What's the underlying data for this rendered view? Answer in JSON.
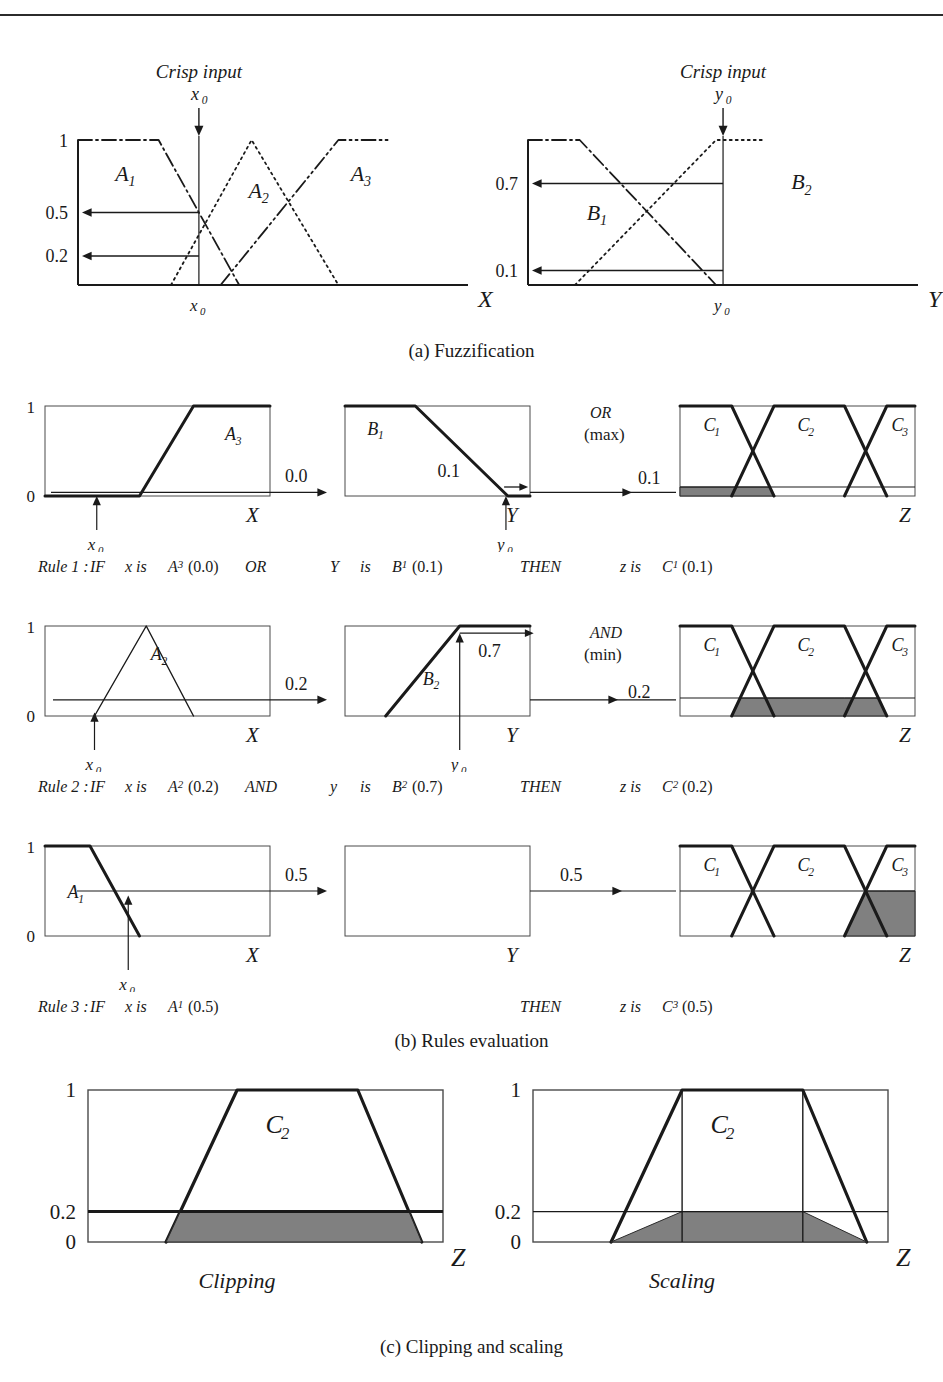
{
  "figure": {
    "top_rule": true,
    "captions": {
      "a": "(a) Fuzzification",
      "b": "(b)  Rules evaluation",
      "c": "(c)  Clipping and scaling"
    }
  },
  "colors": {
    "ink": "#1a1a1a",
    "thin_line": "#4a4a4a",
    "shade_fill": "#808080",
    "shade_stroke": "#2b2b2b"
  },
  "fuzzification": {
    "crisp_label": "Crisp input",
    "left": {
      "input_label": "x₀",
      "axis_label": "X",
      "axis_tick_label": "x₀",
      "y_ticks": [
        "1",
        "0.5",
        "0.2"
      ],
      "sets": [
        "A₁",
        "A₂",
        "A₃"
      ],
      "memberships": {
        "A₁": 0.5,
        "A₂": 0.2,
        "A₃": 0.0
      }
    },
    "right": {
      "input_label": "y₀",
      "axis_label": "Y",
      "axis_tick_label": "y₀",
      "y_ticks": [
        "0.7",
        "0.1"
      ],
      "sets": [
        "B₁",
        "B₂"
      ],
      "memberships": {
        "B₁": 0.1,
        "B₂": 0.7
      }
    }
  },
  "rules": [
    {
      "id": "rule1",
      "number": "Rule 1",
      "operator_label": "OR",
      "operator_sub": "(max)",
      "antecedent_value": "0.0",
      "second_value": "0.1",
      "result_value": "0.1",
      "x_panel": {
        "set": "A₃",
        "axis_label": "X",
        "tick_label": "x₀",
        "y_ticks": [
          "1",
          "0"
        ],
        "shape": "up-trapezoid",
        "membership": 0.0
      },
      "y_panel": {
        "set": "B₁",
        "axis_label": "Y",
        "tick_label": "y₀",
        "shape": "down-trapezoid",
        "membership": 0.1
      },
      "z_panel": {
        "sets": [
          "C₁",
          "C₂",
          "C₃"
        ],
        "axis_label": "Z",
        "clip": 0.1,
        "clipped_set_index": 0
      },
      "text": {
        "prefix": "Rule 1 :",
        "if": "IF",
        "x_is": "x  is",
        "x_set": "A₃",
        "x_val": "(0.0)",
        "op": "OR",
        "y_var": "Y",
        "y_is": "is",
        "y_set": "B₁",
        "y_val": "(0.1)",
        "then": "THEN",
        "z_is": "z  is",
        "z_set": "C₁",
        "z_val": "(0.1)"
      }
    },
    {
      "id": "rule2",
      "number": "Rule 2",
      "operator_label": "AND",
      "operator_sub": "(min)",
      "antecedent_value": "0.2",
      "second_value": "0.7",
      "result_value": "0.2",
      "x_panel": {
        "set": "A₂",
        "axis_label": "X",
        "tick_label": "x₀",
        "y_ticks": [
          "1",
          "0"
        ],
        "shape": "triangle",
        "membership": 0.2
      },
      "y_panel": {
        "set": "B₂",
        "axis_label": "Y",
        "tick_label": "y₀",
        "shape": "up-ramp",
        "membership": 0.7
      },
      "z_panel": {
        "sets": [
          "C₁",
          "C₂",
          "C₃"
        ],
        "axis_label": "Z",
        "clip": 0.2,
        "clipped_set_index": 1
      },
      "text": {
        "prefix": "Rule 2 :",
        "if": "IF",
        "x_is": "x  is",
        "x_set": "A₂",
        "x_val": "(0.2)",
        "op": "AND",
        "y_var": "y",
        "y_is": "is",
        "y_set": "B₂",
        "y_val": "(0.7)",
        "then": "THEN",
        "z_is": "z  is",
        "z_set": "C₂",
        "z_val": "(0.2)"
      }
    },
    {
      "id": "rule3",
      "number": "Rule 3",
      "operator_label": "",
      "operator_sub": "",
      "antecedent_value": "0.5",
      "second_value": "0.5",
      "result_value": "0.5",
      "x_panel": {
        "set": "A₁",
        "axis_label": "X",
        "tick_label": "x₀",
        "y_ticks": [
          "1",
          "0"
        ],
        "shape": "down-ramp",
        "membership": 0.5
      },
      "y_panel": {
        "set": "",
        "axis_label": "Y",
        "tick_label": "",
        "shape": "empty",
        "membership": null
      },
      "z_panel": {
        "sets": [
          "C₁",
          "C₂",
          "C₃"
        ],
        "axis_label": "Z",
        "clip": 0.5,
        "clipped_set_index": 2
      },
      "text": {
        "prefix": "Rule 3 :",
        "if": "IF",
        "x_is": "x  is",
        "x_set": "A₁",
        "x_val": "(0.5)",
        "op": "",
        "y_var": "",
        "y_is": "",
        "y_set": "",
        "y_val": "",
        "then": "THEN",
        "z_is": "z  is",
        "z_set": "C₃",
        "z_val": "(0.5)"
      }
    }
  ],
  "clip_scale": {
    "clipping": {
      "title": "Clipping",
      "set_label": "C₂",
      "axis_label": "Z",
      "y_ticks": [
        "1",
        "0.2",
        "0"
      ],
      "level": 0.2
    },
    "scaling": {
      "title": "Scaling",
      "set_label": "C₂",
      "axis_label": "Z",
      "y_ticks": [
        "1",
        "0.2",
        "0"
      ],
      "level": 0.2
    }
  },
  "chart_data": {
    "type": "line",
    "panels": [
      {
        "name": "fuzzification-x",
        "xlabel": "X",
        "ylabel": "",
        "ylim": [
          0,
          1
        ],
        "yticks": [
          0.2,
          0.5,
          1
        ],
        "crisp_input": "x0",
        "series": [
          {
            "name": "A1",
            "style": "dash-dot",
            "points": [
              [
                0,
                1
              ],
              [
                0.26,
                1
              ],
              [
                0.52,
                0
              ]
            ]
          },
          {
            "name": "A2",
            "style": "dotted",
            "points": [
              [
                0.3,
                0
              ],
              [
                0.56,
                1
              ],
              [
                0.84,
                0
              ]
            ]
          },
          {
            "name": "A3",
            "style": "dash-dot-dot",
            "points": [
              [
                0.46,
                0
              ],
              [
                0.84,
                1
              ],
              [
                1,
                1
              ]
            ]
          }
        ],
        "readings": {
          "A1": 0.5,
          "A2": 0.2,
          "A3": 0.0
        }
      },
      {
        "name": "fuzzification-y",
        "xlabel": "Y",
        "ylabel": "",
        "ylim": [
          0,
          1
        ],
        "yticks": [
          0.1,
          0.7
        ],
        "crisp_input": "y0",
        "series": [
          {
            "name": "B1",
            "style": "dash-dot",
            "points": [
              [
                0,
                1
              ],
              [
                0.22,
                1
              ],
              [
                0.8,
                0
              ]
            ]
          },
          {
            "name": "B2",
            "style": "dotted",
            "points": [
              [
                0.2,
                0
              ],
              [
                0.8,
                1
              ],
              [
                1,
                1
              ]
            ]
          }
        ],
        "readings": {
          "B1": 0.1,
          "B2": 0.7
        }
      },
      {
        "name": "rule1-x",
        "xlabel": "X",
        "ylim": [
          0,
          1
        ],
        "series": [
          {
            "name": "A3",
            "points": [
              [
                0,
                0
              ],
              [
                0.42,
                0
              ],
              [
                0.66,
                1
              ],
              [
                1,
                1
              ]
            ]
          }
        ],
        "reading": 0.0
      },
      {
        "name": "rule1-y",
        "xlabel": "Y",
        "ylim": [
          0,
          1
        ],
        "series": [
          {
            "name": "B1",
            "points": [
              [
                0,
                1
              ],
              [
                0.38,
                1
              ],
              [
                0.88,
                0
              ],
              [
                1,
                0
              ]
            ]
          }
        ],
        "reading": 0.1
      },
      {
        "name": "rule1-z",
        "xlabel": "Z",
        "ylim": [
          0,
          1
        ],
        "clip": 0.1,
        "series": [
          {
            "name": "C1",
            "points": [
              [
                0,
                1
              ],
              [
                0.22,
                1
              ],
              [
                0.4,
                0
              ]
            ]
          },
          {
            "name": "C2",
            "points": [
              [
                0.22,
                0
              ],
              [
                0.4,
                1
              ],
              [
                0.7,
                1
              ],
              [
                0.88,
                0
              ]
            ]
          },
          {
            "name": "C3",
            "points": [
              [
                0.7,
                0
              ],
              [
                0.88,
                1
              ],
              [
                1,
                1
              ]
            ]
          }
        ]
      },
      {
        "name": "rule2-x",
        "xlabel": "X",
        "ylim": [
          0,
          1
        ],
        "series": [
          {
            "name": "A2",
            "points": [
              [
                0.22,
                0
              ],
              [
                0.45,
                1
              ],
              [
                0.66,
                0
              ]
            ]
          }
        ],
        "reading": 0.2
      },
      {
        "name": "rule2-y",
        "xlabel": "Y",
        "ylim": [
          0,
          1
        ],
        "series": [
          {
            "name": "B2",
            "points": [
              [
                0.22,
                0
              ],
              [
                0.62,
                1
              ],
              [
                1,
                1
              ]
            ]
          }
        ],
        "reading": 0.7
      },
      {
        "name": "rule2-z",
        "xlabel": "Z",
        "ylim": [
          0,
          1
        ],
        "clip": 0.2,
        "series": [
          {
            "name": "C1",
            "points": [
              [
                0,
                1
              ],
              [
                0.22,
                1
              ],
              [
                0.4,
                0
              ]
            ]
          },
          {
            "name": "C2",
            "points": [
              [
                0.22,
                0
              ],
              [
                0.4,
                1
              ],
              [
                0.7,
                1
              ],
              [
                0.88,
                0
              ]
            ]
          },
          {
            "name": "C3",
            "points": [
              [
                0.7,
                0
              ],
              [
                0.88,
                1
              ],
              [
                1,
                1
              ]
            ]
          }
        ]
      },
      {
        "name": "rule3-x",
        "xlabel": "X",
        "ylim": [
          0,
          1
        ],
        "series": [
          {
            "name": "A1",
            "points": [
              [
                0,
                1
              ],
              [
                0.2,
                1
              ],
              [
                0.42,
                0
              ]
            ]
          }
        ],
        "reading": 0.5
      },
      {
        "name": "rule3-y",
        "xlabel": "Y",
        "ylim": [
          0,
          1
        ],
        "series": []
      },
      {
        "name": "rule3-z",
        "xlabel": "Z",
        "ylim": [
          0,
          1
        ],
        "clip": 0.5,
        "series": [
          {
            "name": "C1",
            "points": [
              [
                0,
                1
              ],
              [
                0.22,
                1
              ],
              [
                0.4,
                0
              ]
            ]
          },
          {
            "name": "C2",
            "points": [
              [
                0.22,
                0
              ],
              [
                0.4,
                1
              ],
              [
                0.7,
                1
              ],
              [
                0.88,
                0
              ]
            ]
          },
          {
            "name": "C3",
            "points": [
              [
                0.7,
                0
              ],
              [
                0.88,
                1
              ],
              [
                1,
                1
              ]
            ]
          }
        ]
      },
      {
        "name": "clipping",
        "xlabel": "Z",
        "ylim": [
          0,
          1
        ],
        "clip": 0.2,
        "series": [
          {
            "name": "C2",
            "points": [
              [
                0.22,
                0
              ],
              [
                0.42,
                1
              ],
              [
                0.76,
                1
              ],
              [
                0.94,
                0
              ]
            ]
          }
        ]
      },
      {
        "name": "scaling",
        "xlabel": "Z",
        "ylim": [
          0,
          1
        ],
        "scale": 0.2,
        "series": [
          {
            "name": "C2",
            "points": [
              [
                0.22,
                0
              ],
              [
                0.42,
                1
              ],
              [
                0.76,
                1
              ],
              [
                0.94,
                0
              ]
            ]
          }
        ]
      }
    ]
  }
}
